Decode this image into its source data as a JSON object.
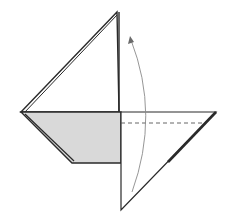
{
  "diagram": {
    "type": "origami-fold-step",
    "colors": {
      "background": "#ffffff",
      "line": "#2a2a2a",
      "shaded_face": "#d9d9d9",
      "arrow": "#8a8a8a",
      "dash": "#555555"
    },
    "points": {
      "top": [
        117,
        12
      ],
      "left": [
        21,
        112
      ],
      "right": [
        216,
        112
      ],
      "bottom": [
        121,
        210
      ],
      "center": [
        119,
        112
      ],
      "shade_bottom_left": [
        72,
        163
      ],
      "shade_bottom_right": [
        121,
        163
      ]
    },
    "fold_line": {
      "style": "valley-dashed",
      "from": [
        121,
        123
      ],
      "to": [
        203,
        123
      ]
    },
    "arrow": {
      "style": "curved-fold-up",
      "from": [
        132,
        192
      ],
      "to": [
        131,
        38
      ]
    }
  }
}
